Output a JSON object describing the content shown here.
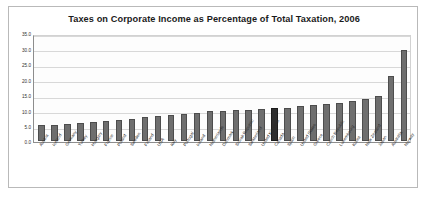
{
  "chart_data": {
    "type": "bar",
    "title": "Taxes on Corporate Income as Percentage of Total Taxation, 2006",
    "xlabel": "",
    "ylabel": "",
    "ylim": [
      0.0,
      35.0
    ],
    "ytick_labels": [
      "35.0",
      "30.0",
      "25.0",
      "20.0",
      "15.0",
      "10.0",
      "5.0",
      "0.0"
    ],
    "ytick_values": [
      35.0,
      30.0,
      25.0,
      20.0,
      15.0,
      10.0,
      5.0,
      0.0
    ],
    "grid": true,
    "legend": "none",
    "highlight_category": "Canada",
    "colors": {
      "bar": "#6e6e6e",
      "bar_highlight": "#2e2e2e",
      "grid": "#d8d8d8",
      "axis": "#8d8d8d",
      "plot_background": "#fdfdfd",
      "frame_border": "#b9b9b9",
      "title_text": "#1b1b1b"
    },
    "categories": [
      "Austria",
      "Iceland",
      "Germany",
      "Turkey",
      "Hungary",
      "France",
      "Poland",
      "Sweden",
      "Finland",
      "USA",
      "Italy",
      "Portugal",
      "Ireland",
      "Netherlands",
      "Denmark",
      "Slovak Republic",
      "Switzerland",
      "United Kingdom",
      "Canada",
      "Spain",
      "United States",
      "Greece",
      "Czech Republic",
      "Luxembourg",
      "Korea",
      "New Zealand",
      "Japan",
      "Australia",
      "Norway"
    ],
    "values": [
      5.2,
      5.4,
      5.6,
      5.8,
      6.2,
      6.6,
      7.0,
      7.4,
      7.8,
      8.2,
      8.6,
      9.0,
      9.4,
      9.8,
      10.0,
      10.2,
      10.4,
      10.6,
      10.8,
      11.0,
      11.4,
      11.8,
      12.2,
      12.6,
      13.2,
      13.8,
      15.0,
      21.5,
      30.0
    ]
  }
}
